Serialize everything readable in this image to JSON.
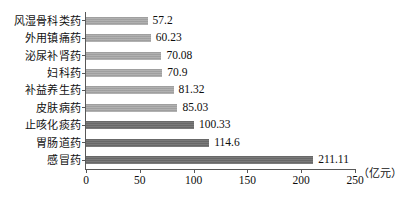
{
  "chart_data": {
    "type": "bar",
    "orientation": "horizontal",
    "title": "",
    "xlabel": "",
    "ylabel": "",
    "unit_label": "（亿元）",
    "xlim": [
      0,
      250
    ],
    "xticks": [
      0,
      50,
      100,
      150,
      200,
      250
    ],
    "grid": false,
    "legend": "none",
    "categories": [
      "风湿骨科类药",
      "外用镇痛药",
      "泌尿补肾药",
      "妇科药",
      "补益养生药",
      "皮肤病药",
      "止咳化痰药",
      "胃肠道药",
      "感冒药"
    ],
    "values": [
      57.2,
      60.23,
      70.08,
      70.9,
      81.32,
      85.03,
      100.33,
      114.6,
      211.11
    ],
    "value_labels": [
      "57.2",
      "60.23",
      "70.08",
      "70.9",
      "81.32",
      "85.03",
      "100.33",
      "114.6",
      "211.11"
    ],
    "bar_styles": [
      "light",
      "light",
      "light",
      "light",
      "light",
      "light",
      "dark",
      "dark",
      "dark"
    ],
    "colors": {
      "bar_light": "#a8a8a8",
      "bar_dark": "#6f6f6f",
      "axis": "#585858",
      "text": "#0d0d0d",
      "background": "#ffffff"
    }
  }
}
